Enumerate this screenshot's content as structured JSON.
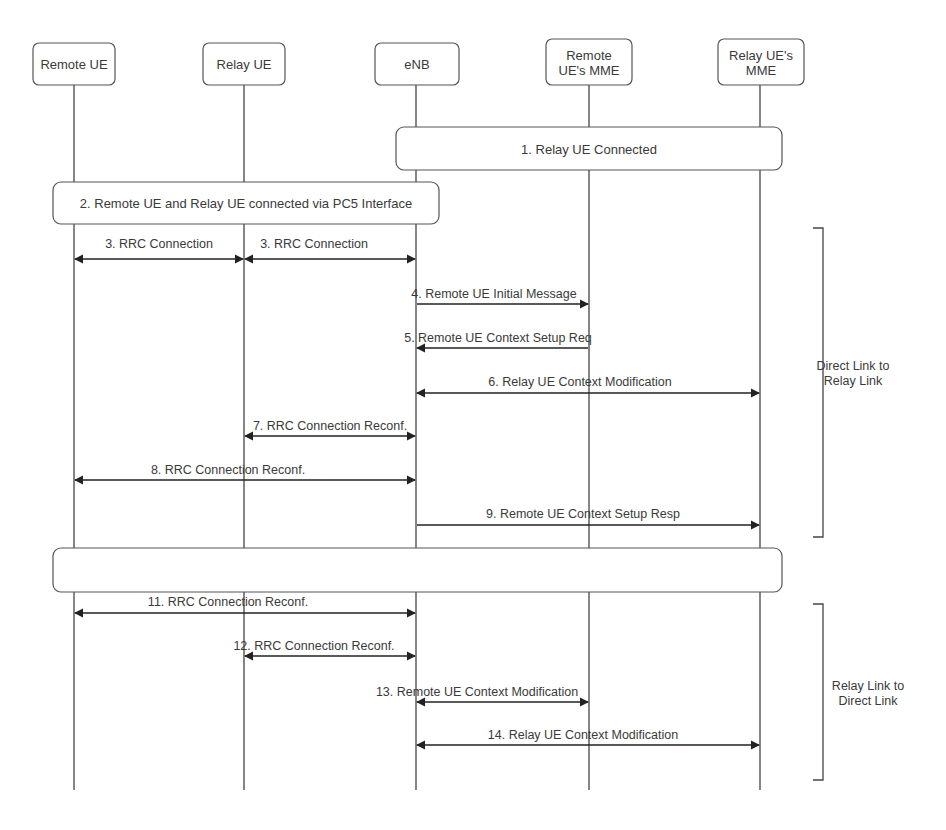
{
  "diagram": {
    "type": "sequence",
    "line_color": "#444444",
    "box_border_color": "#555555",
    "text_color": "#3a3a3a",
    "background": "#ffffff"
  },
  "participants": [
    {
      "id": "remote-ue",
      "label_lines": [
        "Remote UE"
      ],
      "x": 74,
      "box": {
        "x": 33,
        "y": 43,
        "w": 82,
        "h": 42
      }
    },
    {
      "id": "relay-ue",
      "label_lines": [
        "Relay UE"
      ],
      "x": 244,
      "box": {
        "x": 203,
        "y": 43,
        "w": 82,
        "h": 42
      }
    },
    {
      "id": "enb",
      "label_lines": [
        "eNB"
      ],
      "x": 416,
      "box": {
        "x": 375,
        "y": 43,
        "w": 84,
        "h": 42
      }
    },
    {
      "id": "remote-ue-mme",
      "label_lines": [
        "Remote",
        "UE's MME"
      ],
      "x": 589,
      "box": {
        "x": 546,
        "y": 39,
        "w": 86,
        "h": 46
      }
    },
    {
      "id": "relay-ue-mme",
      "label_lines": [
        "Relay UE's",
        "MME"
      ],
      "x": 760,
      "box": {
        "x": 718,
        "y": 39,
        "w": 86,
        "h": 46
      }
    }
  ],
  "lifeline_end_y": 790,
  "spanning_boxes": [
    {
      "id": "step-1",
      "label": "1. Relay UE Connected",
      "x": 396,
      "y": 127,
      "w": 386,
      "h": 43
    },
    {
      "id": "step-2",
      "label": "2. Remote UE and Relay UE connected via PC5 Interface",
      "x": 53,
      "y": 182,
      "w": 386,
      "h": 42
    },
    {
      "id": "step-10",
      "label": "",
      "x": 53,
      "y": 548,
      "w": 729,
      "h": 44
    }
  ],
  "messages": [
    {
      "id": "m3a",
      "label": "3. RRC Connection",
      "from_x": 74,
      "to_x": 244,
      "y": 259,
      "label_x": 159,
      "label_y": 248,
      "arrows": "both"
    },
    {
      "id": "m3b",
      "label": "3. RRC Connection",
      "from_x": 244,
      "to_x": 416,
      "y": 259,
      "label_x": 314,
      "label_y": 248,
      "arrows": "both"
    },
    {
      "id": "m4",
      "label": "4. Remote UE Initial Message",
      "from_x": 416,
      "to_x": 589,
      "y": 304,
      "label_x": 494,
      "label_y": 298,
      "arrows": "end"
    },
    {
      "id": "m5",
      "label": "5. Remote UE Context Setup Req",
      "from_x": 589,
      "to_x": 416,
      "y": 348,
      "label_x": 498,
      "label_y": 342,
      "arrows": "end"
    },
    {
      "id": "m6",
      "label": "6. Relay UE Context Modification",
      "from_x": 416,
      "to_x": 760,
      "y": 393,
      "label_x": 580,
      "label_y": 386,
      "arrows": "both"
    },
    {
      "id": "m7",
      "label": "7. RRC Connection Reconf.",
      "from_x": 244,
      "to_x": 416,
      "y": 436,
      "label_x": 330,
      "label_y": 430,
      "arrows": "both"
    },
    {
      "id": "m8",
      "label": "8. RRC Connection Reconf.",
      "from_x": 74,
      "to_x": 416,
      "y": 480,
      "label_x": 228,
      "label_y": 474,
      "arrows": "both"
    },
    {
      "id": "m9",
      "label": "9. Remote UE Context Setup Resp",
      "from_x": 416,
      "to_x": 760,
      "y": 525,
      "label_x": 583,
      "label_y": 518,
      "arrows": "end"
    },
    {
      "id": "m11",
      "label": "11. RRC Connection Reconf.",
      "from_x": 74,
      "to_x": 416,
      "y": 613,
      "label_x": 228,
      "label_y": 606,
      "arrows": "both"
    },
    {
      "id": "m12",
      "label": "12. RRC Connection Reconf.",
      "from_x": 244,
      "to_x": 416,
      "y": 656,
      "label_x": 314,
      "label_y": 650,
      "arrows": "both"
    },
    {
      "id": "m13",
      "label": "13. Remote UE Context Modification",
      "from_x": 416,
      "to_x": 589,
      "y": 702,
      "label_x": 477,
      "label_y": 696,
      "arrows": "both"
    },
    {
      "id": "m14",
      "label": "14. Relay UE Context Modification",
      "from_x": 416,
      "to_x": 760,
      "y": 745,
      "label_x": 583,
      "label_y": 739,
      "arrows": "both"
    }
  ],
  "phase_brackets": [
    {
      "id": "phase-direct-to-relay",
      "label_lines": [
        "Direct Link to",
        "Relay Link"
      ],
      "x": 823,
      "y_top": 228,
      "y_bottom": 537,
      "label_x": 853,
      "label_y": 370
    },
    {
      "id": "phase-relay-to-direct",
      "label_lines": [
        "Relay Link to",
        "Direct Link"
      ],
      "x": 823,
      "y_top": 604,
      "y_bottom": 780,
      "label_x": 868,
      "label_y": 690
    }
  ]
}
